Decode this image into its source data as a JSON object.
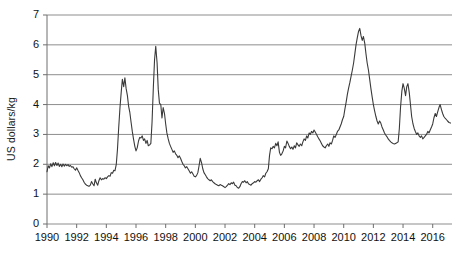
{
  "chart_data": {
    "type": "line",
    "title": "",
    "xlabel": "",
    "ylabel": "US dollars/kg",
    "xlim": [
      1990,
      2017.3
    ],
    "ylim": [
      0,
      7
    ],
    "yticks": [
      0,
      1,
      2,
      3,
      4,
      5,
      6,
      7
    ],
    "xticks": [
      1990,
      1992,
      1994,
      1996,
      1998,
      2000,
      2002,
      2004,
      2006,
      2008,
      2010,
      2012,
      2014,
      2016
    ],
    "grid": "horizontal",
    "legend": "none",
    "line_color": "#3a3a3a",
    "grid_color": "#8d8d8d",
    "axis_color": "#6e6e6e",
    "series": [
      {
        "name": "price",
        "x": [
          1990.0,
          1990.08,
          1990.17,
          1990.25,
          1990.33,
          1990.42,
          1990.5,
          1990.58,
          1990.67,
          1990.75,
          1990.83,
          1990.92,
          1991.0,
          1991.08,
          1991.17,
          1991.25,
          1991.33,
          1991.42,
          1991.5,
          1991.58,
          1991.67,
          1991.75,
          1991.83,
          1991.92,
          1992.0,
          1992.08,
          1992.17,
          1992.25,
          1992.33,
          1992.42,
          1992.5,
          1992.58,
          1992.67,
          1992.75,
          1992.83,
          1992.92,
          1993.0,
          1993.08,
          1993.17,
          1993.25,
          1993.33,
          1993.42,
          1993.5,
          1993.58,
          1993.67,
          1993.75,
          1993.83,
          1993.92,
          1994.0,
          1994.08,
          1994.17,
          1994.25,
          1994.33,
          1994.42,
          1994.5,
          1994.58,
          1994.67,
          1994.75,
          1994.83,
          1994.92,
          1995.0,
          1995.08,
          1995.17,
          1995.25,
          1995.33,
          1995.42,
          1995.5,
          1995.58,
          1995.67,
          1995.75,
          1995.83,
          1995.92,
          1996.0,
          1996.08,
          1996.17,
          1996.25,
          1996.33,
          1996.42,
          1996.5,
          1996.58,
          1996.67,
          1996.75,
          1996.83,
          1996.92,
          1997.0,
          1997.08,
          1997.17,
          1997.25,
          1997.33,
          1997.42,
          1997.5,
          1997.58,
          1997.67,
          1997.75,
          1997.83,
          1997.92,
          1998.0,
          1998.08,
          1998.17,
          1998.25,
          1998.33,
          1998.42,
          1998.5,
          1998.58,
          1998.67,
          1998.75,
          1998.83,
          1998.92,
          1999.0,
          1999.08,
          1999.17,
          1999.25,
          1999.33,
          1999.42,
          1999.5,
          1999.58,
          1999.67,
          1999.75,
          1999.83,
          1999.92,
          2000.0,
          2000.08,
          2000.17,
          2000.25,
          2000.33,
          2000.42,
          2000.5,
          2000.58,
          2000.67,
          2000.75,
          2000.83,
          2000.92,
          2001.0,
          2001.08,
          2001.17,
          2001.25,
          2001.33,
          2001.42,
          2001.5,
          2001.58,
          2001.67,
          2001.75,
          2001.83,
          2001.92,
          2002.0,
          2002.08,
          2002.17,
          2002.25,
          2002.33,
          2002.42,
          2002.5,
          2002.58,
          2002.67,
          2002.75,
          2002.83,
          2002.92,
          2003.0,
          2003.08,
          2003.17,
          2003.25,
          2003.33,
          2003.42,
          2003.5,
          2003.58,
          2003.67,
          2003.75,
          2003.83,
          2003.92,
          2004.0,
          2004.08,
          2004.17,
          2004.25,
          2004.33,
          2004.42,
          2004.5,
          2004.58,
          2004.67,
          2004.75,
          2004.83,
          2004.92,
          2005.0,
          2005.08,
          2005.17,
          2005.25,
          2005.33,
          2005.42,
          2005.5,
          2005.58,
          2005.67,
          2005.75,
          2005.83,
          2005.92,
          2006.0,
          2006.08,
          2006.17,
          2006.25,
          2006.33,
          2006.42,
          2006.5,
          2006.58,
          2006.67,
          2006.75,
          2006.83,
          2006.92,
          2007.0,
          2007.08,
          2007.17,
          2007.25,
          2007.33,
          2007.42,
          2007.5,
          2007.58,
          2007.67,
          2007.75,
          2007.83,
          2007.92,
          2008.0,
          2008.08,
          2008.17,
          2008.25,
          2008.33,
          2008.42,
          2008.5,
          2008.58,
          2008.67,
          2008.75,
          2008.83,
          2008.92,
          2009.0,
          2009.08,
          2009.17,
          2009.25,
          2009.33,
          2009.42,
          2009.5,
          2009.58,
          2009.67,
          2009.75,
          2009.83,
          2009.92,
          2010.0,
          2010.08,
          2010.17,
          2010.25,
          2010.33,
          2010.42,
          2010.5,
          2010.58,
          2010.67,
          2010.75,
          2010.83,
          2010.92,
          2011.0,
          2011.08,
          2011.17,
          2011.25,
          2011.33,
          2011.42,
          2011.5,
          2011.58,
          2011.67,
          2011.75,
          2011.83,
          2011.92,
          2012.0,
          2012.08,
          2012.17,
          2012.25,
          2012.33,
          2012.42,
          2012.5,
          2012.58,
          2012.67,
          2012.75,
          2012.83,
          2012.92,
          2013.0,
          2013.08,
          2013.17,
          2013.25,
          2013.33,
          2013.42,
          2013.5,
          2013.58,
          2013.67,
          2013.75,
          2013.83,
          2013.92,
          2014.0,
          2014.08,
          2014.17,
          2014.25,
          2014.33,
          2014.42,
          2014.5,
          2014.58,
          2014.67,
          2014.75,
          2014.83,
          2014.92,
          2015.0,
          2015.08,
          2015.17,
          2015.25,
          2015.33,
          2015.42,
          2015.5,
          2015.58,
          2015.67,
          2015.75,
          2015.83,
          2015.92,
          2016.0,
          2016.08,
          2016.17,
          2016.25,
          2016.33,
          2016.42,
          2016.5,
          2016.58,
          2016.67,
          2016.75,
          2016.83,
          2016.92,
          2017.0,
          2017.1,
          2017.2
        ],
        "values": [
          1.75,
          1.95,
          1.88,
          2.02,
          1.92,
          2.05,
          1.95,
          2.06,
          1.96,
          2.04,
          1.93,
          2.0,
          1.92,
          2.01,
          1.94,
          2.0,
          1.95,
          1.99,
          1.93,
          1.96,
          1.9,
          1.92,
          1.85,
          1.8,
          1.88,
          1.8,
          1.72,
          1.62,
          1.55,
          1.48,
          1.4,
          1.34,
          1.3,
          1.28,
          1.26,
          1.3,
          1.42,
          1.35,
          1.28,
          1.5,
          1.38,
          1.3,
          1.45,
          1.55,
          1.48,
          1.52,
          1.5,
          1.55,
          1.52,
          1.58,
          1.62,
          1.6,
          1.72,
          1.7,
          1.8,
          1.78,
          2.0,
          2.5,
          3.2,
          3.9,
          4.4,
          4.85,
          4.6,
          4.9,
          4.55,
          4.3,
          3.95,
          3.75,
          3.4,
          3.1,
          2.85,
          2.6,
          2.45,
          2.55,
          2.78,
          2.9,
          2.88,
          2.95,
          2.8,
          2.85,
          2.7,
          2.8,
          2.62,
          2.65,
          2.7,
          3.4,
          4.6,
          5.5,
          5.95,
          5.4,
          4.5,
          4.05,
          4.0,
          3.55,
          3.9,
          3.7,
          3.35,
          3.05,
          2.85,
          2.7,
          2.6,
          2.5,
          2.4,
          2.45,
          2.35,
          2.3,
          2.22,
          2.28,
          2.2,
          2.1,
          2.0,
          1.95,
          1.88,
          1.92,
          1.85,
          1.78,
          1.7,
          1.75,
          1.68,
          1.6,
          1.58,
          1.62,
          1.72,
          1.95,
          2.2,
          2.05,
          1.85,
          1.72,
          1.65,
          1.58,
          1.52,
          1.48,
          1.45,
          1.48,
          1.42,
          1.38,
          1.35,
          1.32,
          1.3,
          1.28,
          1.32,
          1.3,
          1.28,
          1.25,
          1.22,
          1.25,
          1.3,
          1.35,
          1.32,
          1.38,
          1.35,
          1.4,
          1.3,
          1.28,
          1.22,
          1.2,
          1.25,
          1.35,
          1.42,
          1.4,
          1.45,
          1.38,
          1.42,
          1.35,
          1.32,
          1.3,
          1.35,
          1.38,
          1.42,
          1.4,
          1.45,
          1.48,
          1.42,
          1.5,
          1.55,
          1.62,
          1.58,
          1.7,
          1.75,
          1.85,
          2.3,
          2.55,
          2.52,
          2.6,
          2.55,
          2.7,
          2.62,
          2.75,
          2.4,
          2.3,
          2.35,
          2.45,
          2.6,
          2.55,
          2.78,
          2.7,
          2.6,
          2.52,
          2.58,
          2.5,
          2.62,
          2.55,
          2.72,
          2.65,
          2.6,
          2.68,
          2.62,
          2.75,
          2.85,
          2.8,
          2.95,
          2.88,
          3.05,
          3.0,
          3.1,
          3.05,
          3.15,
          3.08,
          3.0,
          2.92,
          2.85,
          2.78,
          2.7,
          2.62,
          2.58,
          2.55,
          2.62,
          2.68,
          2.6,
          2.72,
          2.68,
          2.8,
          2.95,
          2.9,
          3.0,
          3.1,
          3.15,
          3.25,
          3.35,
          3.5,
          3.6,
          3.85,
          4.1,
          4.35,
          4.55,
          4.75,
          4.95,
          5.15,
          5.4,
          5.7,
          6.0,
          6.25,
          6.45,
          6.55,
          6.3,
          6.15,
          6.28,
          6.05,
          5.7,
          5.4,
          5.15,
          4.85,
          4.55,
          4.25,
          4.0,
          3.8,
          3.6,
          3.45,
          3.35,
          3.45,
          3.38,
          3.25,
          3.15,
          3.05,
          2.98,
          2.92,
          2.85,
          2.8,
          2.75,
          2.72,
          2.7,
          2.68,
          2.7,
          2.72,
          2.75,
          3.2,
          3.9,
          4.45,
          4.7,
          4.55,
          4.3,
          4.6,
          4.7,
          4.4,
          4.0,
          3.6,
          3.35,
          3.2,
          3.1,
          3.0,
          3.05,
          2.95,
          2.9,
          2.95,
          2.85,
          2.9,
          2.95,
          3.0,
          3.1,
          3.05,
          3.15,
          3.25,
          3.35,
          3.55,
          3.7,
          3.6,
          3.75,
          3.9,
          4.0,
          3.85,
          3.7,
          3.6,
          3.55,
          3.5,
          3.45,
          3.4,
          3.38
        ]
      }
    ]
  }
}
